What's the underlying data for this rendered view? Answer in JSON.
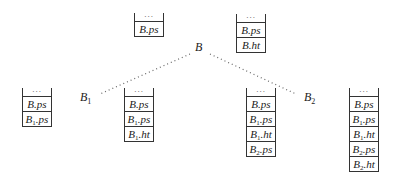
{
  "labels": {
    "root": "B",
    "child1": "B",
    "child1_sub": "1",
    "child2": "B",
    "child2_sub": "2"
  },
  "stacks": [
    {
      "id": "stack-before-B",
      "top_marker": "...",
      "cells": [
        {
          "base": "B",
          "sub": "",
          "field": ".ps"
        }
      ]
    },
    {
      "id": "stack-after-B",
      "top_marker": "...",
      "cells": [
        {
          "base": "B",
          "sub": "",
          "field": ".ps"
        },
        {
          "base": "B",
          "sub": "",
          "field": ".ht"
        }
      ]
    },
    {
      "id": "stack-before-B1",
      "top_marker": "...",
      "cells": [
        {
          "base": "B",
          "sub": "",
          "field": ".ps"
        },
        {
          "base": "B",
          "sub": "1",
          "field": ".ps"
        }
      ]
    },
    {
      "id": "stack-after-B1",
      "top_marker": "...",
      "cells": [
        {
          "base": "B",
          "sub": "",
          "field": ".ps"
        },
        {
          "base": "B",
          "sub": "1",
          "field": ".ps"
        },
        {
          "base": "B",
          "sub": "1",
          "field": ".ht"
        }
      ]
    },
    {
      "id": "stack-before-B2",
      "top_marker": "...",
      "cells": [
        {
          "base": "B",
          "sub": "",
          "field": ".ps"
        },
        {
          "base": "B",
          "sub": "1",
          "field": ".ps"
        },
        {
          "base": "B",
          "sub": "1",
          "field": ".ht"
        },
        {
          "base": "B",
          "sub": "2",
          "field": ".ps"
        }
      ]
    },
    {
      "id": "stack-after-B2",
      "top_marker": "...",
      "cells": [
        {
          "base": "B",
          "sub": "",
          "field": ".ps"
        },
        {
          "base": "B",
          "sub": "1",
          "field": ".ps"
        },
        {
          "base": "B",
          "sub": "1",
          "field": ".ht"
        },
        {
          "base": "B",
          "sub": "2",
          "field": ".ps"
        },
        {
          "base": "B",
          "sub": "2",
          "field": ".ht"
        }
      ]
    }
  ],
  "edges": [
    {
      "from": "B",
      "to": "B1",
      "style": "dotted"
    },
    {
      "from": "B",
      "to": "B2",
      "style": "dotted"
    }
  ]
}
